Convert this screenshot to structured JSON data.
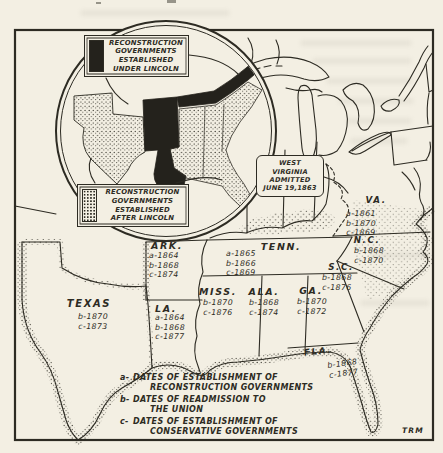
{
  "colors": {
    "ink": "#2d2b23",
    "paper": "#f3efe3",
    "solid_fill": "#24221c"
  },
  "inset": {
    "under_lincoln": {
      "swatch": "black-solid",
      "lines": [
        "RECONSTRUCTION",
        "GOVERNMENTS",
        "ESTABLISHED",
        "UNDER LINCOLN"
      ]
    },
    "after_lincoln": {
      "swatch": "stippled",
      "lines": [
        "RECONSTRUCTION",
        "GOVERNMENTS",
        "ESTABLISHED",
        "AFTER LINCOLN"
      ]
    }
  },
  "callout": {
    "west_virginia": {
      "lines": [
        "WEST",
        "VIRGINIA",
        "ADMITTED",
        "JUNE 19,1863"
      ]
    }
  },
  "states": [
    {
      "name": "TEXAS",
      "dates": [
        "b-1870",
        "c-1873"
      ]
    },
    {
      "name": "ARK.",
      "dates": [
        "a-1864",
        "b-1868",
        "c-1874"
      ]
    },
    {
      "name": "LA.",
      "dates": [
        "a-1864",
        "b-1868",
        "c-1877"
      ]
    },
    {
      "name": "TENN.",
      "dates": [
        "a-1865",
        "b-1866",
        "c-1869"
      ]
    },
    {
      "name": "MISS.",
      "dates": [
        "b-1870",
        "c-1876"
      ]
    },
    {
      "name": "ALA.",
      "dates": [
        "b-1868",
        "c-1874"
      ]
    },
    {
      "name": "GA.",
      "dates": [
        "b-1870",
        "c-1872"
      ]
    },
    {
      "name": "VA.",
      "dates": [
        "a-1861",
        "b-1870",
        "c-1869"
      ]
    },
    {
      "name": "N.C.",
      "dates": [
        "b-1868",
        "c-1870"
      ]
    },
    {
      "name": "S.C.",
      "dates": [
        "b-1868",
        "c-1876"
      ]
    },
    {
      "name": "FLA.",
      "dates": [
        "b-1868",
        "c-1877"
      ]
    }
  ],
  "legend": {
    "items": [
      {
        "key": "a-",
        "line1": "DATES OF ESTABLISHMENT OF",
        "line2": "RECONSTRUCTION GOVERNMENTS"
      },
      {
        "key": "b-",
        "line1": "DATES OF READMISSION TO",
        "line2": "THE UNION"
      },
      {
        "key": "c-",
        "line1": "DATES OF ESTABLISHMENT OF",
        "line2": "CONSERVATIVE GOVERNMENTS"
      }
    ]
  },
  "signature": "TRM"
}
